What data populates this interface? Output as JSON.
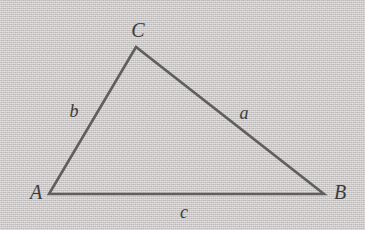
{
  "figure": {
    "type": "geometry-diagram",
    "shape": "triangle",
    "background_color": "#cdc9c9",
    "stroke_color": "#5f5f5f",
    "label_color": "#3b3b3b",
    "stroke_width": 2.6,
    "vertices": [
      {
        "name": "A",
        "label": "A",
        "x": 49,
        "y": 194,
        "label_x": 36,
        "label_y": 192
      },
      {
        "name": "B",
        "label": "B",
        "x": 324,
        "y": 194,
        "label_x": 340,
        "label_y": 192
      },
      {
        "name": "C",
        "label": "C",
        "x": 136,
        "y": 47,
        "label_x": 138,
        "label_y": 30
      }
    ],
    "sides": [
      {
        "name": "a",
        "label": "a",
        "from": "B",
        "to": "C",
        "label_x": 244,
        "label_y": 113
      },
      {
        "name": "b",
        "label": "b",
        "from": "A",
        "to": "C",
        "label_x": 74,
        "label_y": 111
      },
      {
        "name": "c",
        "label": "c",
        "from": "A",
        "to": "B",
        "label_x": 184,
        "label_y": 212
      }
    ],
    "polygon_points": "49,194 136,47 324,194"
  }
}
